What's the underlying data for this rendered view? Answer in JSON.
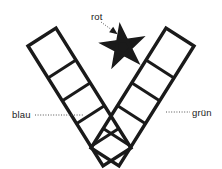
{
  "figure": {
    "background_color": "#ffffff",
    "ink_color": "#1a1a1a",
    "leader_color": "#555555"
  },
  "labels": {
    "red": {
      "text": "rot",
      "x": 91,
      "y": 20,
      "anchor": "start",
      "target": "star",
      "leader": {
        "x1": 101,
        "y1": 22,
        "x2": 116,
        "y2": 33,
        "arrow": true
      }
    },
    "blue": {
      "text": "blau",
      "x": 12,
      "y": 118,
      "anchor": "start",
      "target": "left-band",
      "leader": {
        "x1": 35,
        "y1": 115,
        "x2": 83,
        "y2": 115,
        "arrow": false
      }
    },
    "green": {
      "text": "grün",
      "x": 192,
      "y": 116,
      "anchor": "start",
      "target": "right-band",
      "leader": {
        "x1": 166,
        "y1": 112,
        "x2": 190,
        "y2": 112,
        "arrow": false
      }
    }
  },
  "shapes": {
    "left_band": {
      "name": "blau-band",
      "outline": "M 28,46 L 56,28 L 131,148 L 103,166 Z",
      "rungs": [
        "M 48,78 L 76,60",
        "M 62,101 L 90,83",
        "M 76,124 L 104,106",
        "M 90,147 L 118,129"
      ],
      "stroke_width": 3.4,
      "rung_width": 3.0
    },
    "right_band": {
      "name": "gruen-band",
      "outline": "M 194,46 L 166,28 L 91,148 L 119,166 Z",
      "rungs": [
        "M 174,78 L 146,60",
        "M 160,101 L 132,83",
        "M 146,124 L 118,106",
        "M 132,147 L 104,129"
      ],
      "stroke_width": 3.4,
      "rung_width": 3.0
    },
    "star": {
      "name": "rot-star",
      "center_x": 123,
      "center_y": 47,
      "outer_radius": 20,
      "inner_radius": 8.2,
      "rotation_deg": -8,
      "points": 5,
      "style": "pentagram"
    }
  }
}
